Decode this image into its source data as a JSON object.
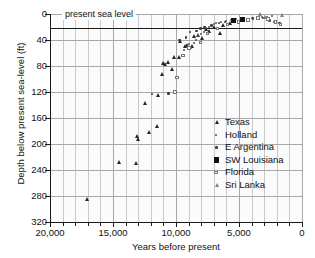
{
  "chart_data": {
    "type": "scatter",
    "title": "",
    "xlabel": "Years before present",
    "ylabel": "Depth below present sea-level (ft)",
    "xlim": [
      20000,
      0
    ],
    "ylim": [
      320,
      0
    ],
    "x_ticks": [
      20000,
      15000,
      10000,
      5000,
      0
    ],
    "x_tick_labels": [
      "20,000",
      "15,000",
      "10,000",
      "5,000",
      "0"
    ],
    "x_minor_tick_step": 1000,
    "y_ticks": [
      0,
      40,
      80,
      120,
      160,
      200,
      240,
      280,
      320
    ],
    "y_tick_labels": [
      "0",
      "40",
      "80",
      "120",
      "160",
      "200",
      "240",
      "280",
      "320"
    ],
    "grid": true,
    "x_axis_reversed": true,
    "y_axis_inverted": true,
    "legend_position": "lower-right-inside",
    "annotations": [
      {
        "text": "present sea level",
        "x": 16500,
        "y": 0,
        "line": "horizontal-at-y-0"
      }
    ],
    "series": [
      {
        "name": "Texas",
        "marker": "triangle-filled",
        "color": "#262626",
        "points": [
          [
            17050,
            285
          ],
          [
            14500,
            228
          ],
          [
            13100,
            230
          ],
          [
            13050,
            188
          ],
          [
            12950,
            192
          ],
          [
            12100,
            182
          ],
          [
            12450,
            138
          ],
          [
            11450,
            173
          ],
          [
            11350,
            125
          ],
          [
            11100,
            92
          ],
          [
            10950,
            76
          ],
          [
            10800,
            78
          ],
          [
            10600,
            74
          ],
          [
            10300,
            85
          ],
          [
            10150,
            67
          ],
          [
            9750,
            66
          ],
          [
            9600,
            42
          ],
          [
            9250,
            50
          ],
          [
            9050,
            48
          ],
          [
            8700,
            50
          ],
          [
            8500,
            35
          ],
          [
            8200,
            33
          ],
          [
            7900,
            38
          ],
          [
            7600,
            24
          ],
          [
            7300,
            26
          ],
          [
            6900,
            20
          ],
          [
            6500,
            30
          ],
          [
            6200,
            18
          ],
          [
            5700,
            14
          ]
        ]
      },
      {
        "name": "Holland",
        "marker": "dot-small",
        "color": "#555555",
        "points": [
          [
            9400,
            56
          ],
          [
            9000,
            46
          ],
          [
            8800,
            52
          ],
          [
            8600,
            44
          ],
          [
            8400,
            40
          ],
          [
            8250,
            34
          ],
          [
            8000,
            30
          ],
          [
            7800,
            28
          ],
          [
            7600,
            22
          ],
          [
            7350,
            20
          ],
          [
            7000,
            16
          ],
          [
            6800,
            14
          ],
          [
            6400,
            12
          ],
          [
            6000,
            10
          ],
          [
            5600,
            9
          ],
          [
            5200,
            8
          ],
          [
            4800,
            8
          ],
          [
            4400,
            7
          ],
          [
            4000,
            6
          ],
          [
            3600,
            5
          ],
          [
            3200,
            4
          ],
          [
            2800,
            4
          ],
          [
            2400,
            3
          ]
        ]
      },
      {
        "name": "E Argentina",
        "marker": "dot",
        "color": "#3a3a3a",
        "points": [
          [
            11900,
            123
          ],
          [
            10600,
            122
          ],
          [
            9700,
            40
          ],
          [
            9200,
            36
          ],
          [
            8900,
            28
          ],
          [
            8350,
            26
          ],
          [
            8050,
            22
          ],
          [
            7750,
            20
          ],
          [
            7200,
            18
          ],
          [
            6600,
            14
          ],
          [
            6100,
            12
          ],
          [
            5400,
            11
          ],
          [
            4600,
            9
          ],
          [
            3900,
            7
          ],
          [
            3100,
            6
          ],
          [
            2600,
            10
          ],
          [
            2200,
            12
          ],
          [
            1800,
            14
          ]
        ]
      },
      {
        "name": "SW Louisiana",
        "marker": "square-filled",
        "color": "#121212",
        "points": [
          [
            5450,
            10
          ],
          [
            4700,
            8
          ]
        ]
      },
      {
        "name": "Florida",
        "marker": "square-open",
        "color": "#777777",
        "points": [
          [
            10100,
            120
          ],
          [
            9900,
            98
          ],
          [
            9450,
            64
          ],
          [
            8950,
            52
          ],
          [
            8050,
            44
          ],
          [
            7500,
            30
          ],
          [
            6700,
            22
          ],
          [
            5900,
            16
          ],
          [
            5050,
            12
          ],
          [
            4300,
            9
          ],
          [
            3500,
            6
          ],
          [
            2700,
            8
          ],
          [
            2100,
            12
          ],
          [
            1700,
            16
          ]
        ]
      },
      {
        "name": "Sri Lanka",
        "marker": "triangle-open",
        "color": "#7a7a7a",
        "points": [
          [
            3250,
            1
          ],
          [
            2900,
            5
          ],
          [
            1550,
            2
          ]
        ]
      }
    ]
  },
  "axes": {
    "x_title": "Years before present",
    "y_title": "Depth below present sea-level (ft)"
  },
  "annotation": {
    "sea_level": "present sea level"
  },
  "legend": {
    "entries": [
      {
        "label": "Texas",
        "marker": "triangle-filled"
      },
      {
        "label": "Holland",
        "marker": "dot-small"
      },
      {
        "label": "E Argentina",
        "marker": "dot"
      },
      {
        "label": "SW Louisiana",
        "marker": "square-filled"
      },
      {
        "label": "Florida",
        "marker": "square-open"
      },
      {
        "label": "Sri Lanka",
        "marker": "triangle-open"
      }
    ]
  }
}
